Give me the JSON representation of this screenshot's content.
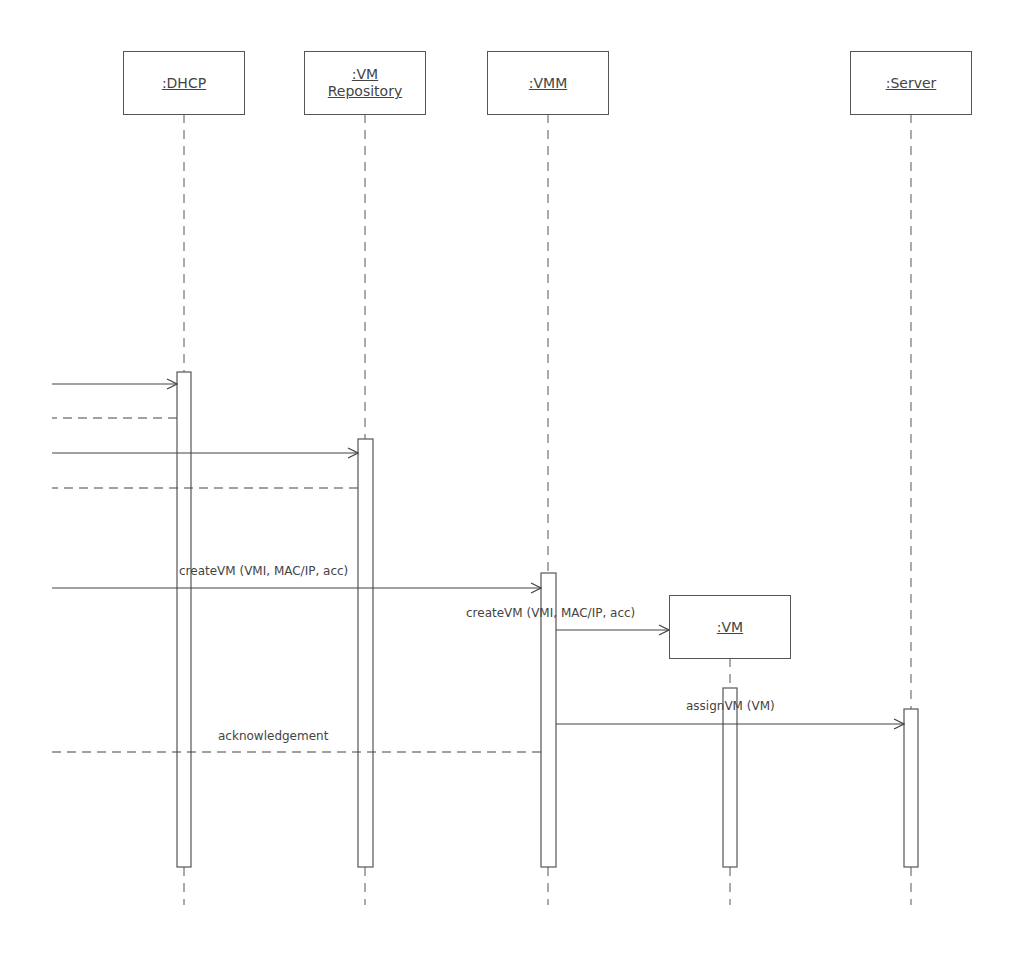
{
  "diagram": {
    "type": "UML sequence diagram",
    "lifelines": [
      {
        "id": "dhcp",
        "lines": [
          ":DHCP"
        ],
        "x": 184
      },
      {
        "id": "vm-repository",
        "lines": [
          ":VM",
          "Repository"
        ],
        "x": 365
      },
      {
        "id": "vmm",
        "lines": [
          ":VMM"
        ],
        "x": 548
      },
      {
        "id": "server",
        "lines": [
          ":Server"
        ],
        "x": 911
      },
      {
        "id": "vm",
        "lines": [
          ":VM"
        ],
        "x": 730
      }
    ],
    "messages": [
      {
        "id": "m1",
        "label": "",
        "kind": "sync",
        "from": "left-edge",
        "to": "dhcp",
        "y": 384
      },
      {
        "id": "m2",
        "label": "",
        "kind": "return",
        "from": "dhcp",
        "to": "left-edge",
        "y": 418
      },
      {
        "id": "m3",
        "label": "",
        "kind": "sync",
        "from": "left-edge",
        "to": "vm-repository",
        "y": 453
      },
      {
        "id": "m4",
        "label": "",
        "kind": "return",
        "from": "vm-repository",
        "to": "left-edge",
        "y": 488
      },
      {
        "id": "m5",
        "label": "createVM (VMI, MAC/IP, acc)",
        "kind": "sync",
        "from": "left-edge",
        "to": "vmm",
        "y": 588
      },
      {
        "id": "m6",
        "label": "createVM (VMI, MAC/IP, acc)",
        "kind": "create",
        "from": "vmm",
        "to": "vm",
        "y": 630
      },
      {
        "id": "m7",
        "label": "assignVM (VM)",
        "kind": "sync",
        "from": "vmm",
        "to": "server",
        "y": 724
      },
      {
        "id": "m8",
        "label": "acknowledgement",
        "kind": "return",
        "from": "vmm",
        "to": "left-edge",
        "y": 752
      }
    ]
  }
}
